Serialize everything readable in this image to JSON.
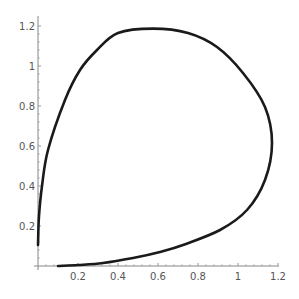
{
  "chart_data": {
    "type": "line",
    "title": "",
    "xlabel": "",
    "ylabel": "",
    "xlim": [
      0,
      1.2
    ],
    "ylim": [
      0,
      1.2
    ],
    "grid": false,
    "legend": null,
    "x_ticks": [
      "0.2",
      "0.4",
      "0.6",
      "0.8",
      "1",
      "1.2"
    ],
    "x_tick_values": [
      0.2,
      0.4,
      0.6,
      0.8,
      1.0,
      1.2
    ],
    "y_ticks": [
      "0.2",
      "0.4",
      "0.6",
      "0.8",
      "1",
      "1.2"
    ],
    "y_tick_values": [
      0.2,
      0.4,
      0.6,
      0.8,
      1.0,
      1.2
    ],
    "series": [
      {
        "name": "parametric-curve",
        "color": "#1a1a1a",
        "points": [
          [
            0.1,
            0.0
          ],
          [
            0.2,
            0.005
          ],
          [
            0.325,
            0.015
          ],
          [
            0.475,
            0.04
          ],
          [
            0.61,
            0.07
          ],
          [
            0.725,
            0.105
          ],
          [
            0.91,
            0.18
          ],
          [
            1.045,
            0.28
          ],
          [
            1.135,
            0.43
          ],
          [
            1.17,
            0.615
          ],
          [
            1.135,
            0.795
          ],
          [
            1.025,
            0.965
          ],
          [
            0.895,
            1.095
          ],
          [
            0.75,
            1.165
          ],
          [
            0.575,
            1.187
          ],
          [
            0.4,
            1.165
          ],
          [
            0.295,
            1.08
          ],
          [
            0.21,
            0.98
          ],
          [
            0.135,
            0.83
          ],
          [
            0.05,
            0.58
          ],
          [
            0.02,
            0.4
          ],
          [
            0.005,
            0.25
          ],
          [
            0.0,
            0.105
          ]
        ]
      }
    ]
  }
}
